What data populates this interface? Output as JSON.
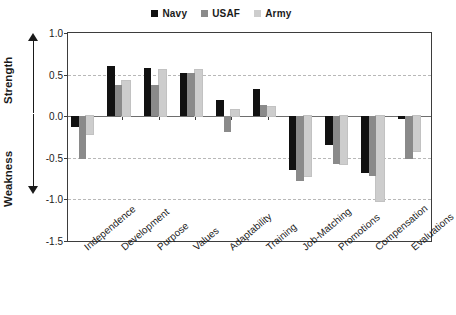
{
  "chart_data": {
    "type": "bar",
    "title": "",
    "subtitle": "",
    "xlabel": "",
    "ylabel": "",
    "ylim": [
      -1.5,
      1.0
    ],
    "yticks": [
      "1.0",
      "0.5",
      "0.0",
      "-0.5",
      "-1.0",
      "-1.5"
    ],
    "ytick_values": [
      1.0,
      0.5,
      0.0,
      -0.5,
      -1.0,
      -1.5
    ],
    "grid": "horizontal-dashed",
    "legend_position": "top-center",
    "axis_annotations": {
      "positive_direction": "Strength",
      "negative_direction": "Weakness"
    },
    "categories": [
      "Independence",
      "Development",
      "Purpose",
      "Values",
      "Adaptability",
      "Training",
      "Job-Matching",
      "Promotions",
      "Compensation",
      "Evaluations"
    ],
    "series": [
      {
        "name": "Navy",
        "color": "#111111",
        "values": [
          -0.13,
          0.6,
          0.58,
          0.52,
          0.2,
          0.33,
          -0.65,
          -0.35,
          -0.68,
          -0.03
        ]
      },
      {
        "name": "USAF",
        "color": "#8a8a8a",
        "values": [
          -0.52,
          0.38,
          0.38,
          0.52,
          -0.19,
          0.13,
          -0.78,
          -0.58,
          -0.72,
          -0.52
        ]
      },
      {
        "name": "Army",
        "color": "#cdcdcd",
        "values": [
          -0.22,
          0.42,
          0.55,
          0.56,
          0.08,
          0.11,
          -0.72,
          -0.58,
          -1.02,
          -0.42
        ]
      }
    ]
  },
  "colors": {
    "navy": "#111111",
    "usaf": "#8a8a8a",
    "army": "#cdcdcd",
    "axis": "#3d3d3d",
    "grid": "#b8b8b8",
    "background": "#ffffff"
  }
}
